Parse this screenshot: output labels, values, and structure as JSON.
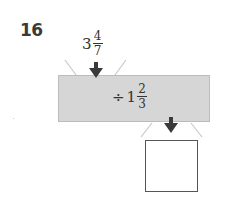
{
  "problem": {
    "number": "16",
    "input": {
      "whole": "3",
      "numerator": "4",
      "denominator": "7"
    },
    "operation": {
      "symbol": "÷",
      "whole": "1",
      "numerator": "2",
      "denominator": "3"
    },
    "output": {
      "value": ""
    }
  },
  "colors": {
    "machine_fill": "#d6d6d6",
    "arrow": "#3a3a3a",
    "funnel_lines": "#c8c8c8",
    "output_border": "#555555"
  }
}
